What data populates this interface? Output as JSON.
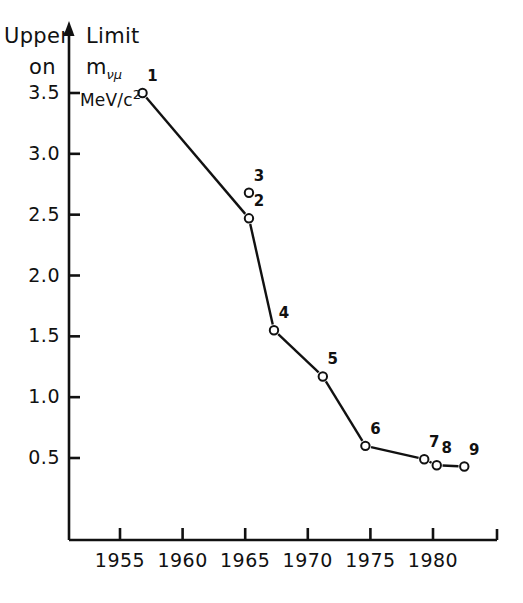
{
  "figure": {
    "axis_title_line1_part1": "Upper",
    "axis_title_line1_part2": "Limit",
    "axis_title_line2_part1": "on",
    "axis_title_line2_part2": "m",
    "axis_title_line2_sub": "νμ",
    "units_prefix": "MeV/c",
    "units_exponent": "2"
  },
  "chart_data": {
    "type": "scatter",
    "title": "Upper Limit on mνμ",
    "xlabel": "",
    "ylabel": "Upper Limit on mνμ (MeV/c²)",
    "xlim": [
      1952.2,
      1982.2
    ],
    "ylim": [
      -0.17,
      3.72
    ],
    "grid": false,
    "legend": "none",
    "marker": "open-circle",
    "xticks": [
      1955,
      1960,
      1965,
      1970,
      1975,
      1980
    ],
    "xtick_labels": [
      "1955",
      "1960",
      "1965",
      "1970",
      "1975",
      "1980"
    ],
    "yticks": [
      0.5,
      1.0,
      1.5,
      2.0,
      2.5,
      3.0,
      3.5
    ],
    "ytick_labels": [
      "0.5",
      "1.0",
      "1.5",
      "2.0",
      "2.5",
      "3.0",
      "3.5"
    ],
    "points": [
      {
        "label": "1",
        "x": 1956.8,
        "y": 3.5
      },
      {
        "label": "2",
        "x": 1965.3,
        "y": 2.47
      },
      {
        "label": "3",
        "x": 1965.3,
        "y": 2.68
      },
      {
        "label": "4",
        "x": 1967.3,
        "y": 1.55
      },
      {
        "label": "5",
        "x": 1971.2,
        "y": 1.17
      },
      {
        "label": "6",
        "x": 1974.6,
        "y": 0.6
      },
      {
        "label": "7",
        "x": 1979.3,
        "y": 0.49
      },
      {
        "label": "8",
        "x": 1980.3,
        "y": 0.44
      },
      {
        "label": "9",
        "x": 1982.5,
        "y": 0.43
      }
    ],
    "connected_labels": [
      "1",
      "2",
      "4",
      "5",
      "6",
      "7",
      "8",
      "9"
    ],
    "unconnected_labels": [
      "3"
    ]
  }
}
